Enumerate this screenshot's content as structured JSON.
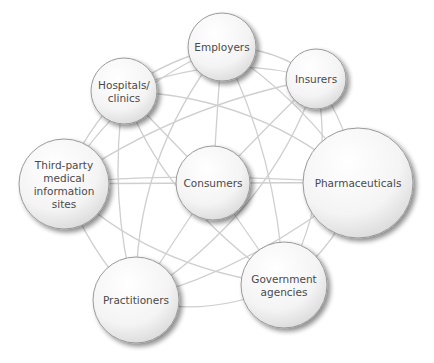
{
  "diagram": {
    "type": "network",
    "edge_color": "#cfcfcf",
    "node_stroke": "#9a9a9a",
    "label_color": "#4a4a4a",
    "nodes": [
      {
        "id": "employers",
        "label_lines": [
          "Employers"
        ],
        "cx": 222,
        "cy": 47,
        "r": 34
      },
      {
        "id": "hospitals",
        "label_lines": [
          "Hospitals/",
          "clinics"
        ],
        "cx": 124,
        "cy": 91,
        "r": 33
      },
      {
        "id": "insurers",
        "label_lines": [
          "Insurers"
        ],
        "cx": 316,
        "cy": 79,
        "r": 30
      },
      {
        "id": "third-party",
        "label_lines": [
          "Third-party",
          "medical",
          "information",
          "sites"
        ],
        "cx": 64,
        "cy": 184,
        "r": 45
      },
      {
        "id": "consumers",
        "label_lines": [
          "Consumers"
        ],
        "cx": 213,
        "cy": 183,
        "r": 37
      },
      {
        "id": "pharmaceuticals",
        "label_lines": [
          "Pharmaceuticals"
        ],
        "cx": 358,
        "cy": 183,
        "r": 55
      },
      {
        "id": "government",
        "label_lines": [
          "Government",
          "agencies"
        ],
        "cx": 284,
        "cy": 285,
        "r": 43
      },
      {
        "id": "practitioners",
        "label_lines": [
          "Practitioners"
        ],
        "cx": 136,
        "cy": 300,
        "r": 43
      }
    ],
    "edges": [
      [
        "employers",
        "hospitals"
      ],
      [
        "employers",
        "insurers"
      ],
      [
        "employers",
        "consumers"
      ],
      [
        "employers",
        "practitioners"
      ],
      [
        "employers",
        "government"
      ],
      [
        "employers",
        "third-party"
      ],
      [
        "employers",
        "pharmaceuticals"
      ],
      [
        "hospitals",
        "insurers"
      ],
      [
        "hospitals",
        "consumers"
      ],
      [
        "hospitals",
        "pharmaceuticals"
      ],
      [
        "hospitals",
        "third-party"
      ],
      [
        "hospitals",
        "government"
      ],
      [
        "hospitals",
        "practitioners"
      ],
      [
        "insurers",
        "consumers"
      ],
      [
        "insurers",
        "pharmaceuticals"
      ],
      [
        "insurers",
        "practitioners"
      ],
      [
        "insurers",
        "third-party"
      ],
      [
        "insurers",
        "government"
      ],
      [
        "third-party",
        "consumers"
      ],
      [
        "third-party",
        "pharmaceuticals"
      ],
      [
        "third-party",
        "practitioners"
      ],
      [
        "third-party",
        "government"
      ],
      [
        "consumers",
        "pharmaceuticals"
      ],
      [
        "consumers",
        "government"
      ],
      [
        "consumers",
        "practitioners"
      ],
      [
        "pharmaceuticals",
        "government"
      ],
      [
        "pharmaceuticals",
        "practitioners"
      ],
      [
        "government",
        "practitioners"
      ]
    ]
  }
}
